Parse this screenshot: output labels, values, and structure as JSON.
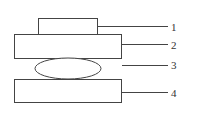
{
  "diagram": {
    "type": "schematic",
    "stroke_color": "#444444",
    "components": [
      {
        "id": "1",
        "label": "1",
        "shape": "rectangle"
      },
      {
        "id": "2",
        "label": "2",
        "shape": "rectangle"
      },
      {
        "id": "3",
        "label": "3",
        "shape": "ellipse"
      },
      {
        "id": "4",
        "label": "4",
        "shape": "rectangle"
      }
    ]
  }
}
